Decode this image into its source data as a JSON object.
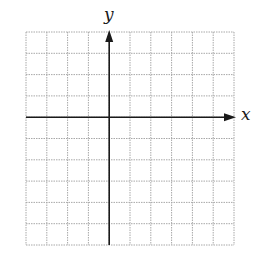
{
  "figure": {
    "type": "coordinate-grid",
    "x_axis_label": "x",
    "y_axis_label": "y",
    "grid": {
      "columns": 10,
      "rows": 10,
      "y_axis_column": 4,
      "x_axis_row": 4,
      "line_style": "dotted"
    },
    "colors": {
      "grid_line": "#a8a8a8",
      "axis": "#1a1a1a",
      "background": "#ffffff"
    }
  }
}
